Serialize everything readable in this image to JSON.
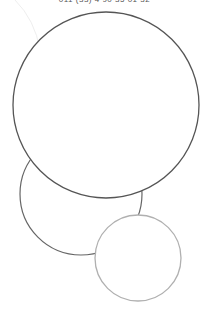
{
  "header": {
    "phone_text": "011 (33) 4 90 35 01 32"
  },
  "shapes": {
    "stroke_dark": "#555555",
    "stroke_light": "#b0b0b0",
    "stroke_faint": "#eeeeee"
  }
}
